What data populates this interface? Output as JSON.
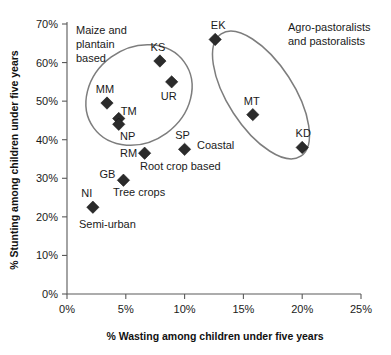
{
  "chart_data": {
    "type": "scatter",
    "title": "",
    "xlabel": "% Wasting among children under five years",
    "ylabel": "% Stunting among children under five years",
    "xlim": [
      0,
      25
    ],
    "ylim": [
      0,
      70
    ],
    "xticks": [
      "0%",
      "5%",
      "10%",
      "15%",
      "20%",
      "25%"
    ],
    "xtick_values": [
      0,
      5,
      10,
      15,
      20,
      25
    ],
    "yticks": [
      "0%",
      "10%",
      "20%",
      "30%",
      "40%",
      "50%",
      "60%",
      "70%"
    ],
    "ytick_values": [
      0,
      10,
      20,
      30,
      40,
      50,
      60,
      70
    ],
    "grid": false,
    "legend": "none",
    "points": [
      {
        "code": "KS",
        "x": 7.9,
        "y": 60.4,
        "label_dx": -2,
        "label_dy": -10
      },
      {
        "code": "UR",
        "x": 8.9,
        "y": 55.0,
        "label_dx": -3,
        "label_dy": 18
      },
      {
        "code": "MM",
        "x": 3.4,
        "y": 49.5,
        "label_dx": -2,
        "label_dy": -10
      },
      {
        "code": "TM",
        "x": 4.4,
        "y": 45.5,
        "label_dx": 10,
        "label_dy": -4
      },
      {
        "code": "NP",
        "x": 4.4,
        "y": 44.0,
        "label_dx": 9,
        "label_dy": 16
      },
      {
        "code": "EK",
        "x": 12.6,
        "y": 66.0,
        "label_dx": 3,
        "label_dy": -10
      },
      {
        "code": "MT",
        "x": 15.8,
        "y": 46.5,
        "label_dx": -1,
        "label_dy": -10
      },
      {
        "code": "KD",
        "x": 20.0,
        "y": 38.0,
        "label_dx": 1,
        "label_dy": -10
      },
      {
        "code": "SP",
        "x": 10.0,
        "y": 37.5,
        "label_dx": -2,
        "label_dy": -10
      },
      {
        "code": "RM",
        "x": 6.6,
        "y": 36.5,
        "label_dx": -16,
        "label_dy": 4
      },
      {
        "code": "GB",
        "x": 4.8,
        "y": 29.5,
        "label_dx": -16,
        "label_dy": -2
      },
      {
        "code": "NI",
        "x": 2.2,
        "y": 22.5,
        "label_dx": -6,
        "label_dy": -10
      }
    ],
    "group_annotations": [
      {
        "name": "maize-plantain-group",
        "lines": [
          "Maize and",
          "plantain",
          "based"
        ],
        "x": 76,
        "y": 34,
        "anchor": "start"
      },
      {
        "name": "agro-pastoralist-group",
        "lines": [
          "Agro-pastoralists",
          "and pastoralists"
        ],
        "x": 288,
        "y": 31,
        "anchor": "start"
      },
      {
        "name": "coastal-group",
        "lines": [
          "Coastal"
        ],
        "x": 197,
        "y": 149,
        "anchor": "start"
      },
      {
        "name": "root-crop-group",
        "lines": [
          "Root crop based"
        ],
        "x": 140,
        "y": 170,
        "anchor": "start"
      },
      {
        "name": "tree-crops-group",
        "lines": [
          "Tree crops"
        ],
        "x": 113,
        "y": 196,
        "anchor": "start"
      },
      {
        "name": "semi-urban-group",
        "lines": [
          "Semi-urban"
        ],
        "x": 79,
        "y": 228,
        "anchor": "start"
      }
    ],
    "ellipses": [
      {
        "name": "maize-plantain-ellipse",
        "cx": 139,
        "cy": 95,
        "rx": 56,
        "ry": 47,
        "rotate": -36
      },
      {
        "name": "agro-pastoralist-ellipse",
        "cx": 261,
        "cy": 95,
        "rx": 33,
        "ry": 73,
        "rotate": -33
      }
    ]
  }
}
